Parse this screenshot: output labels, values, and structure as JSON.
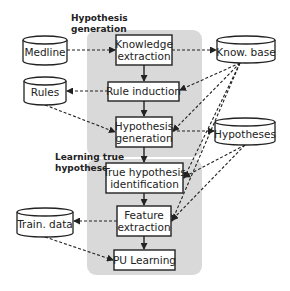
{
  "sections": {
    "hypothesis_generation": {
      "line1": "Hypothesis",
      "line2": "generation"
    },
    "learning_true_hypotheses": {
      "line1": "Learning true",
      "line2": "hypotheses"
    }
  },
  "process_boxes": {
    "knowledge_extraction": {
      "line1": "Knowledge",
      "line2": "extraction"
    },
    "rule_induction": {
      "line1": "Rule induction"
    },
    "hypothesis_generation": {
      "line1": "Hypothesis",
      "line2": "generation"
    },
    "true_hypothesis_identification": {
      "line1": "True hypothesis",
      "line2": "identification"
    },
    "feature_extraction": {
      "line1": "Feature",
      "line2": "extraction"
    },
    "pu_learning": {
      "line1": "PU Learning"
    }
  },
  "data_stores": {
    "medline": "Medline",
    "rules": "Rules",
    "know_base": "Know. base",
    "hypotheses": "Hypotheses",
    "train_data": "Train. data"
  },
  "colors": {
    "region_fill": "#d9d9d9",
    "stroke": "#222222",
    "box_fill": "#ffffff"
  }
}
